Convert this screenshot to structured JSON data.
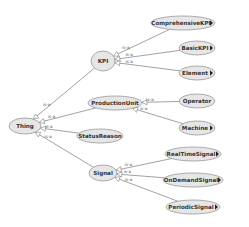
{
  "diagram": {
    "type": "ontology-class-hierarchy",
    "colors": {
      "background": "#ffffff",
      "node_fill": "#e6e6e6",
      "node_stroke": "#8c8c8c",
      "edge": "#7a7a7a",
      "text": "#333333",
      "expand_marker": "#222222"
    },
    "nodes": [
      {
        "id": "thing",
        "label": "Thing",
        "cx": 25,
        "cy": 126,
        "rx": 16,
        "ry": 8,
        "expandable": false
      },
      {
        "id": "kpi",
        "label": "KPI",
        "cx": 103,
        "cy": 61,
        "rx": 12,
        "ry": 10,
        "expandable": false
      },
      {
        "id": "productionunit",
        "label": "ProductionUnit",
        "cx": 115,
        "cy": 103,
        "rx": 27,
        "ry": 7,
        "expandable": false
      },
      {
        "id": "statusreason",
        "label": "StatusReason",
        "cx": 100,
        "cy": 136,
        "rx": 23,
        "ry": 7,
        "expandable": false
      },
      {
        "id": "signal",
        "label": "Signal",
        "cx": 103,
        "cy": 173,
        "rx": 14,
        "ry": 8,
        "expandable": false
      },
      {
        "id": "comprehensivekpi",
        "label": "ComprehensiveKPI",
        "cx": 183,
        "cy": 23,
        "rx": 32,
        "ry": 7,
        "expandable": true
      },
      {
        "id": "basickpi",
        "label": "BasicKPI",
        "cx": 197,
        "cy": 48,
        "rx": 18,
        "ry": 7,
        "expandable": true
      },
      {
        "id": "element",
        "label": "Element",
        "cx": 197,
        "cy": 73,
        "rx": 18,
        "ry": 7,
        "expandable": true
      },
      {
        "id": "operator",
        "label": "Operator",
        "cx": 197,
        "cy": 101,
        "rx": 18,
        "ry": 7,
        "expandable": false
      },
      {
        "id": "machine",
        "label": "Machine",
        "cx": 197,
        "cy": 128,
        "rx": 18,
        "ry": 7,
        "expandable": true
      },
      {
        "id": "realtimesignal",
        "label": "RealTimeSignal",
        "cx": 193,
        "cy": 154,
        "rx": 28,
        "ry": 7,
        "expandable": true
      },
      {
        "id": "ondemandsignal",
        "label": "OnDemandSignal",
        "cx": 193,
        "cy": 180,
        "rx": 30,
        "ry": 7,
        "expandable": true
      },
      {
        "id": "periodicsignal",
        "label": "PeriodicSignal",
        "cx": 193,
        "cy": 207,
        "rx": 27,
        "ry": 7,
        "expandable": true
      }
    ],
    "edges": [
      {
        "from": "kpi",
        "to": "thing",
        "label": "is-a"
      },
      {
        "from": "productionunit",
        "to": "thing",
        "label": "is-a"
      },
      {
        "from": "statusreason",
        "to": "thing",
        "label": "is-a"
      },
      {
        "from": "signal",
        "to": "thing",
        "label": "is-a"
      },
      {
        "from": "comprehensivekpi",
        "to": "kpi",
        "label": "is-a"
      },
      {
        "from": "basickpi",
        "to": "kpi",
        "label": "is-a"
      },
      {
        "from": "element",
        "to": "kpi",
        "label": "is-a"
      },
      {
        "from": "operator",
        "to": "productionunit",
        "label": "is-a"
      },
      {
        "from": "machine",
        "to": "productionunit",
        "label": "is-a"
      },
      {
        "from": "realtimesignal",
        "to": "signal",
        "label": "is-a"
      },
      {
        "from": "ondemandsignal",
        "to": "signal",
        "label": "is-a"
      },
      {
        "from": "periodicsignal",
        "to": "signal",
        "label": "is-a"
      }
    ]
  }
}
